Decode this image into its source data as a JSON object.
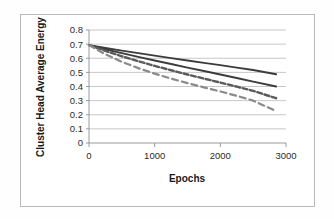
{
  "figure": {
    "background_color": "#ffffff",
    "frame_color": "#b9b9b9"
  },
  "chart_data": {
    "type": "line",
    "title": "",
    "xlabel": "Epochs",
    "ylabel": "Cluster Head Average Energy",
    "xlim": [
      0,
      3000
    ],
    "ylim": [
      0,
      0.8
    ],
    "xticks": [
      0,
      1000,
      2000,
      3000
    ],
    "xtick_labels": [
      "0",
      "1000",
      "2000",
      "3000"
    ],
    "yticks": [
      0,
      0.1,
      0.2,
      0.3,
      0.4,
      0.5,
      0.6,
      0.7,
      0.8
    ],
    "ytick_labels": [
      "0",
      "0.1",
      "0.2",
      "0.3",
      "0.4",
      "0.5",
      "0.6",
      "0.7",
      "0.8"
    ],
    "grid": "horizontal",
    "legend": "none",
    "x": [
      0,
      250,
      500,
      750,
      1000,
      1250,
      1500,
      1750,
      2000,
      2250,
      2500,
      2850
    ],
    "series": [
      {
        "name": "series-1",
        "style": "solid",
        "color": "#3c3c3c",
        "width": 1.9,
        "values": [
          0.693,
          0.673,
          0.654,
          0.636,
          0.619,
          0.601,
          0.584,
          0.567,
          0.551,
          0.534,
          0.517,
          0.487
        ]
      },
      {
        "name": "series-2",
        "style": "solid",
        "color": "#3c3c3c",
        "width": 1.9,
        "values": [
          0.693,
          0.664,
          0.636,
          0.61,
          0.584,
          0.559,
          0.534,
          0.51,
          0.485,
          0.46,
          0.435,
          0.4
        ]
      },
      {
        "name": "series-3",
        "style": "dashed",
        "color": "#5a5a5a",
        "width": 2.4,
        "values": [
          0.693,
          0.652,
          0.614,
          0.579,
          0.546,
          0.515,
          0.485,
          0.456,
          0.428,
          0.399,
          0.369,
          0.317
        ]
      },
      {
        "name": "series-4",
        "style": "dashed",
        "color": "#8a8a8a",
        "width": 2.2,
        "values": [
          0.693,
          0.628,
          0.575,
          0.53,
          0.491,
          0.456,
          0.424,
          0.394,
          0.365,
          0.334,
          0.3,
          0.226
        ]
      }
    ]
  }
}
